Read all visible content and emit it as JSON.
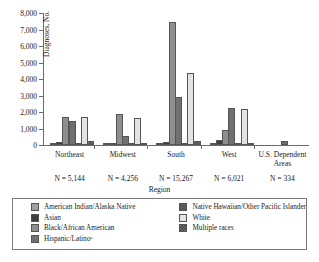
{
  "chart_data": {
    "type": "bar",
    "title": "",
    "xlabel": "Region",
    "ylabel": "Diagnoses, No.",
    "ylim": [
      0,
      8000
    ],
    "ytick_labels": [
      "0",
      "1,000",
      "2,000",
      "3,000",
      "4,000",
      "5,000",
      "6,000",
      "7,000",
      "8,000"
    ],
    "ytick_values": [
      0,
      1000,
      2000,
      3000,
      4000,
      5000,
      6000,
      7000,
      8000
    ],
    "grid": false,
    "legend_position": "bottom",
    "categories": [
      "Northeast",
      "Midwest",
      "South",
      "West",
      "U.S. Dependent Areas"
    ],
    "category_notes": [
      "N = 5,144",
      "N = 4,256",
      "N = 15,267",
      "N = 6,021",
      "N = 334"
    ],
    "series": [
      {
        "name": "American Indian/Alaska Native",
        "color": "#a0a0a0",
        "key": "amerind",
        "values": [
          20,
          15,
          40,
          45,
          0
        ]
      },
      {
        "name": "Asian",
        "color": "#3d3d3d",
        "key": "asian",
        "values": [
          190,
          60,
          210,
          280,
          0
        ]
      },
      {
        "name": "Black/African American",
        "color": "#8e8e8e",
        "key": "black",
        "values": [
          1700,
          1900,
          7450,
          900,
          0
        ]
      },
      {
        "name": "Hispanic/Latinoᵃ",
        "color": "#707070",
        "key": "hisp",
        "values": [
          1450,
          520,
          2900,
          2270,
          250
        ]
      },
      {
        "name": "Native Hawaiian/Other Pacific Islander",
        "color": "#5a5a5a",
        "key": "nhopi",
        "values": [
          10,
          8,
          25,
          40,
          0
        ]
      },
      {
        "name": "White",
        "color": "#e3e3e1",
        "key": "white",
        "values": [
          1700,
          1620,
          4350,
          2200,
          0
        ]
      },
      {
        "name": "Multiple races",
        "color": "#6e6e6e",
        "key": "multi",
        "values": [
          250,
          40,
          250,
          60,
          0
        ]
      }
    ]
  }
}
